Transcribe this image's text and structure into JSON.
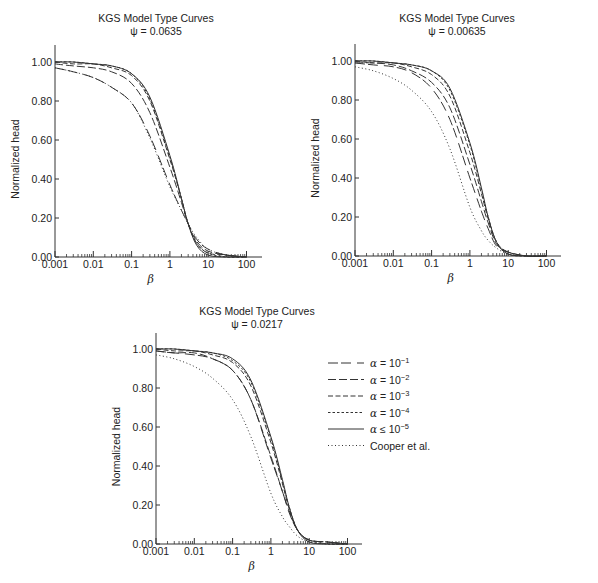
{
  "legend": {
    "entries": [
      {
        "key": "a1",
        "label_prefix": "α",
        "label_op": "=",
        "label_base": "10",
        "label_exp": "−1",
        "dash": "10,3,10,6"
      },
      {
        "key": "a2",
        "label_prefix": "α",
        "label_op": "=",
        "label_base": "10",
        "label_exp": "−2",
        "dash": "8,3"
      },
      {
        "key": "a3",
        "label_prefix": "α",
        "label_op": "=",
        "label_base": "10",
        "label_exp": "−3",
        "dash": "5,2.5"
      },
      {
        "key": "a4",
        "label_prefix": "α",
        "label_op": "=",
        "label_base": "10",
        "label_exp": "−4",
        "dash": "2.5,2"
      },
      {
        "key": "a5",
        "label_prefix": "α",
        "label_op": "≤",
        "label_base": "10",
        "label_exp": "−5",
        "dash": ""
      },
      {
        "key": "cooper",
        "label_text": "Cooper et al.",
        "dash": "1,2.5"
      }
    ]
  },
  "chart_data": [
    {
      "type": "line",
      "title": "KGS Model Type Curves",
      "subtitle": "ψ = 0.0635",
      "xlabel": "β",
      "ylabel": "Normalized head",
      "xscale": "log",
      "xlim": [
        0.001,
        300
      ],
      "ylim": [
        0.0,
        1.08
      ],
      "xticks": [
        "0.001",
        "0.01",
        "0.1",
        "1",
        "10",
        "100"
      ],
      "yticks": [
        "0.00",
        "0.20",
        "0.40",
        "0.60",
        "0.80",
        "1.00"
      ],
      "grid": false,
      "x": [
        0.001,
        0.003,
        0.01,
        0.03,
        0.1,
        0.3,
        1,
        2,
        3,
        5,
        10,
        30,
        100
      ],
      "series": [
        {
          "name": "α = 10^-1",
          "key": "a1",
          "values": [
            0.97,
            0.95,
            0.92,
            0.87,
            0.79,
            0.62,
            0.37,
            0.24,
            0.17,
            0.09,
            0.04,
            0.01,
            0.0
          ]
        },
        {
          "name": "α = 10^-2",
          "key": "a2",
          "values": [
            0.99,
            0.98,
            0.97,
            0.95,
            0.89,
            0.74,
            0.46,
            0.28,
            0.17,
            0.08,
            0.03,
            0.01,
            0.0
          ]
        },
        {
          "name": "α = 10^-3",
          "key": "a3",
          "values": [
            1.0,
            0.99,
            0.99,
            0.97,
            0.93,
            0.8,
            0.5,
            0.3,
            0.17,
            0.07,
            0.02,
            0.01,
            0.0
          ]
        },
        {
          "name": "α = 10^-4",
          "key": "a4",
          "values": [
            1.0,
            1.0,
            0.99,
            0.98,
            0.94,
            0.81,
            0.51,
            0.3,
            0.17,
            0.07,
            0.02,
            0.0,
            0.0
          ]
        },
        {
          "name": "α ≤ 10^-5",
          "key": "a5",
          "values": [
            1.0,
            1.0,
            0.99,
            0.98,
            0.94,
            0.82,
            0.52,
            0.3,
            0.17,
            0.06,
            0.01,
            0.0,
            0.0
          ]
        },
        {
          "name": "Cooper et al.",
          "key": "cooper",
          "values": [
            0.97,
            0.95,
            0.92,
            0.87,
            0.79,
            0.61,
            0.36,
            0.24,
            0.17,
            0.1,
            0.04,
            0.01,
            0.0
          ]
        }
      ]
    },
    {
      "type": "line",
      "title": "KGS Model Type Curves",
      "subtitle": "ψ = 0.00635",
      "xlabel": "β",
      "ylabel": "Normalized head",
      "xscale": "log",
      "xlim": [
        0.001,
        300
      ],
      "ylim": [
        0.0,
        1.08
      ],
      "xticks": [
        "0.001",
        "0.01",
        "0.1",
        "1",
        "10",
        "100"
      ],
      "yticks": [
        "0.00",
        "0.20",
        "0.40",
        "0.60",
        "0.80",
        "1.00"
      ],
      "grid": false,
      "x": [
        0.001,
        0.003,
        0.01,
        0.03,
        0.1,
        0.3,
        1,
        2,
        3,
        5,
        10,
        30,
        100
      ],
      "series": [
        {
          "name": "α = 10^-1",
          "key": "a1",
          "values": [
            0.99,
            0.98,
            0.97,
            0.94,
            0.86,
            0.7,
            0.4,
            0.23,
            0.14,
            0.05,
            0.02,
            0.0,
            0.0
          ]
        },
        {
          "name": "α = 10^-2",
          "key": "a2",
          "values": [
            0.99,
            0.99,
            0.98,
            0.95,
            0.89,
            0.76,
            0.47,
            0.28,
            0.17,
            0.06,
            0.02,
            0.0,
            0.0
          ]
        },
        {
          "name": "α = 10^-3",
          "key": "a3",
          "values": [
            1.0,
            0.99,
            0.99,
            0.97,
            0.93,
            0.82,
            0.53,
            0.32,
            0.19,
            0.07,
            0.02,
            0.0,
            0.0
          ]
        },
        {
          "name": "α = 10^-4",
          "key": "a4",
          "values": [
            1.0,
            1.0,
            0.99,
            0.98,
            0.95,
            0.85,
            0.57,
            0.34,
            0.2,
            0.07,
            0.01,
            0.0,
            0.0
          ]
        },
        {
          "name": "α ≤ 10^-5",
          "key": "a5",
          "values": [
            1.0,
            1.0,
            0.99,
            0.98,
            0.95,
            0.86,
            0.58,
            0.35,
            0.2,
            0.07,
            0.01,
            0.0,
            0.0
          ]
        },
        {
          "name": "Cooper et al.",
          "key": "cooper",
          "values": [
            0.97,
            0.95,
            0.91,
            0.85,
            0.74,
            0.55,
            0.25,
            0.13,
            0.08,
            0.04,
            0.01,
            0.0,
            0.0
          ]
        }
      ]
    },
    {
      "type": "line",
      "title": "KGS Model Type Curves",
      "subtitle": "ψ = 0.0217",
      "xlabel": "β",
      "ylabel": "Normalized head",
      "xscale": "log",
      "xlim": [
        0.001,
        300
      ],
      "ylim": [
        0.0,
        1.08
      ],
      "xticks": [
        "0.001",
        "0.01",
        "0.1",
        "1",
        "10",
        "100"
      ],
      "yticks": [
        "0.00",
        "0.20",
        "0.40",
        "0.60",
        "0.80",
        "1.00"
      ],
      "grid": false,
      "legend_position": "right",
      "x": [
        0.001,
        0.003,
        0.01,
        0.03,
        0.1,
        0.3,
        1,
        2,
        3,
        5,
        10,
        30,
        100
      ],
      "series": [
        {
          "name": "α = 10^-1",
          "key": "a1",
          "values": [
            0.99,
            0.98,
            0.97,
            0.95,
            0.89,
            0.74,
            0.44,
            0.27,
            0.16,
            0.07,
            0.02,
            0.01,
            0.0
          ]
        },
        {
          "name": "α = 10^-2",
          "key": "a2",
          "values": [
            0.99,
            0.98,
            0.98,
            0.95,
            0.89,
            0.74,
            0.45,
            0.27,
            0.17,
            0.07,
            0.02,
            0.01,
            0.0
          ]
        },
        {
          "name": "α = 10^-3",
          "key": "a3",
          "values": [
            1.0,
            0.99,
            0.99,
            0.97,
            0.93,
            0.81,
            0.52,
            0.31,
            0.18,
            0.07,
            0.02,
            0.01,
            0.0
          ]
        },
        {
          "name": "α = 10^-4",
          "key": "a4",
          "values": [
            1.0,
            1.0,
            0.99,
            0.98,
            0.94,
            0.83,
            0.54,
            0.32,
            0.19,
            0.07,
            0.02,
            0.0,
            0.0
          ]
        },
        {
          "name": "α ≤ 10^-5",
          "key": "a5",
          "values": [
            1.0,
            1.0,
            0.99,
            0.98,
            0.95,
            0.84,
            0.55,
            0.33,
            0.19,
            0.07,
            0.01,
            0.0,
            0.0
          ]
        },
        {
          "name": "Cooper et al.",
          "key": "cooper",
          "values": [
            0.97,
            0.95,
            0.91,
            0.85,
            0.74,
            0.55,
            0.26,
            0.14,
            0.09,
            0.04,
            0.01,
            0.0,
            0.0
          ]
        }
      ]
    }
  ]
}
